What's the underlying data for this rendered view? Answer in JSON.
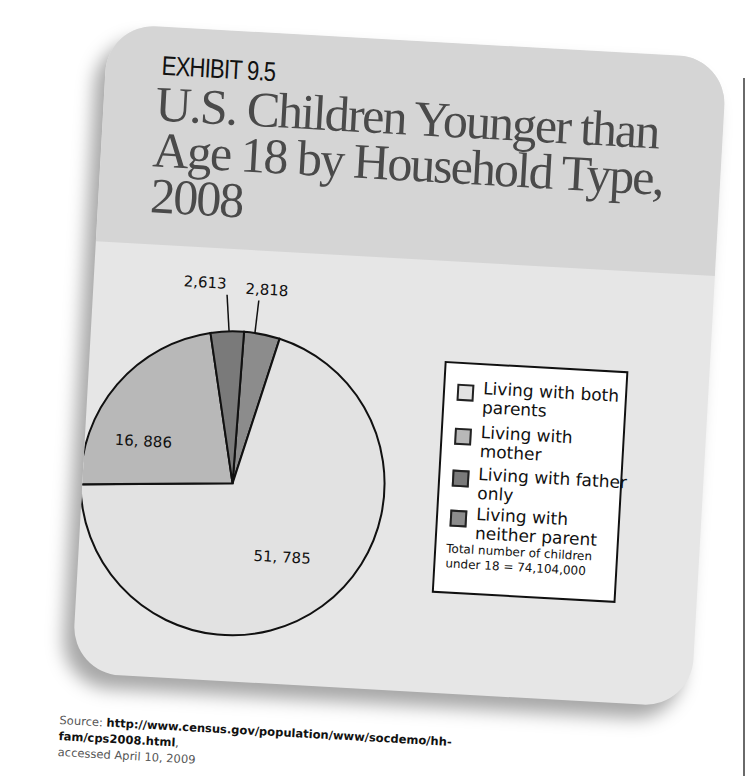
{
  "exhibit": {
    "label": "EXHIBIT 9.5",
    "title": "U.S. Children Younger than Age 18 by Household Type, 2008"
  },
  "legend": {
    "items": [
      {
        "label": "Living with both parents",
        "color": "#e2e2e2"
      },
      {
        "label": "Living with mother",
        "color": "#b8b8b8"
      },
      {
        "label": "Living with father only",
        "color": "#7a7a7a"
      },
      {
        "label": "Living with neither parent",
        "color": "#8c8c8c"
      }
    ],
    "note": "Total number of children under 18 = 74,104,000"
  },
  "source": {
    "prefix": "Source: ",
    "url": "http://www.census.gov/population/www/socdemo/hh-fam/cps2008.html",
    "suffix": ",",
    "accessed": "accessed April 10, 2009"
  },
  "slice_labels": {
    "both": "51, 785",
    "mother": "16, 886",
    "father": "2,613",
    "neither": "2,818"
  },
  "chart_data": {
    "type": "pie",
    "title": "U.S. Children Younger than Age 18 by Household Type, 2008",
    "categories": [
      "Living with both parents",
      "Living with mother",
      "Living with father only",
      "Living with neither parent"
    ],
    "values": [
      51785,
      16886,
      2613,
      2818
    ],
    "units": "thousands of children",
    "total": 74104000,
    "colors": [
      "#e2e2e2",
      "#b8b8b8",
      "#7a7a7a",
      "#8c8c8c"
    ],
    "legend_position": "right",
    "annotations": [
      "Total number of children under 18 = 74,104,000"
    ]
  }
}
